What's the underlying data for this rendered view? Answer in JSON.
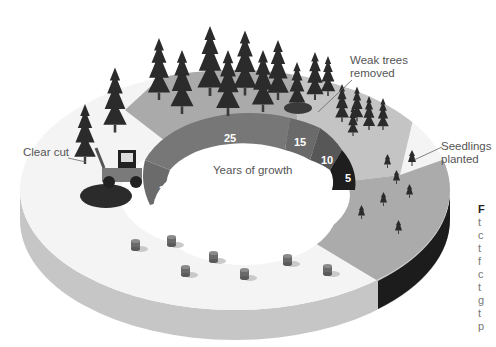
{
  "diagram": {
    "center_label": "Years of growth",
    "stages": [
      {
        "name": "clear-cut",
        "label": "Clear cut"
      },
      {
        "name": "seedlings",
        "label": "Seedlings planted"
      },
      {
        "name": "weak-removed",
        "label": "Weak trees removed"
      }
    ],
    "labels": {
      "clear_cut": "Clear cut",
      "weak_line1": "Weak trees",
      "weak_line2": "removed",
      "seed_line1": "Seedlings",
      "seed_line2": "planted"
    },
    "years": [
      {
        "value": "5",
        "color": "#1e1e1e"
      },
      {
        "value": "10",
        "color": "#555555"
      },
      {
        "value": "15",
        "color": "#6a6a6a"
      },
      {
        "value": "25",
        "color": "#777777"
      },
      {
        "value": "30",
        "color": "#6d6d6d"
      }
    ],
    "colors": {
      "ring_light": "#f4f4f4",
      "ring_mid": "#b9b9b9",
      "ring_dark": "#a3a3a3",
      "ring_side": "#c8c8c8",
      "ring_side_dark": "#1a1a1a",
      "tree": "#2a2a2a"
    }
  },
  "side_text": {
    "heading": "F",
    "lines": [
      "t",
      "c",
      "t",
      "f",
      "c",
      "t",
      "g",
      "t",
      "p"
    ]
  }
}
